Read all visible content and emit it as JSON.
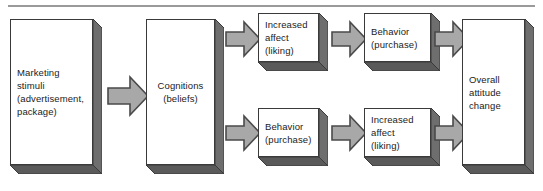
{
  "diagram": {
    "colors": {
      "box_face": "#ffffff",
      "box_outline": "#3a3a3a",
      "box_shadow": "#5a5a5a",
      "box_side": "#6e6e6e",
      "arrow_fill": "#a8a8a8",
      "arrow_outline": "#4a4a4a",
      "rule": "#9a9a9a",
      "text": "#1b1b1b",
      "background": "#ffffff"
    },
    "nodes": [
      {
        "id": "marketing-stimuli",
        "label": "Marketing\nstimuli\n(advertisement,\npackage)",
        "align": "left"
      },
      {
        "id": "cognitions",
        "label": "Cognitions\n(beliefs)",
        "align": "center"
      },
      {
        "id": "increased-affect-top",
        "label": "Increased\naffect\n(liking)",
        "align": "left"
      },
      {
        "id": "behavior-top",
        "label": "Behavior\n(purchase)",
        "align": "left"
      },
      {
        "id": "behavior-bottom",
        "label": "Behavior\n(purchase)",
        "align": "left"
      },
      {
        "id": "increased-affect-bottom",
        "label": "Increased\naffect\n(liking)",
        "align": "left"
      },
      {
        "id": "overall-attitude-change",
        "label": "Overall\nattitude\nchange",
        "align": "left"
      }
    ],
    "connectors": [
      {
        "id": "arrow-stimuli-to-cognitions",
        "from": "marketing-stimuli",
        "to": "cognitions",
        "direction": "right"
      },
      {
        "id": "arrow-cognitions-to-affect-top",
        "from": "cognitions",
        "to": "increased-affect-top",
        "direction": "right"
      },
      {
        "id": "arrow-cognitions-to-behavior-bottom",
        "from": "cognitions",
        "to": "behavior-bottom",
        "direction": "right"
      },
      {
        "id": "arrow-affect-top-to-behavior-top",
        "from": "increased-affect-top",
        "to": "behavior-top",
        "direction": "right"
      },
      {
        "id": "arrow-behavior-bottom-to-affect-bottom",
        "from": "behavior-bottom",
        "to": "increased-affect-bottom",
        "direction": "right"
      },
      {
        "id": "arrow-behavior-top-to-overall",
        "from": "behavior-top",
        "to": "overall-attitude-change",
        "direction": "right"
      },
      {
        "id": "arrow-affect-bottom-to-overall",
        "from": "increased-affect-bottom",
        "to": "overall-attitude-change",
        "direction": "right"
      }
    ]
  }
}
